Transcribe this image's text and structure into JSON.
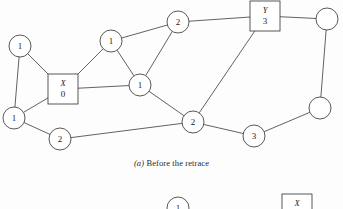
{
  "figure": {
    "caption_tag": "(a)",
    "caption_text": " Before the retrace",
    "width": 343,
    "height": 209,
    "stroke_color": "#3a3a3a",
    "fill_color": "#ffffff",
    "background": "#fdfdfd"
  },
  "graph": {
    "nodes": [
      {
        "id": "n1",
        "shape": "circle",
        "label": "1",
        "name": "",
        "cx": 20,
        "cy": 46,
        "r": 11
      },
      {
        "id": "n2",
        "shape": "square",
        "label": "0",
        "name": "X",
        "cx": 63,
        "cy": 89,
        "r": 15
      },
      {
        "id": "n3",
        "shape": "circle",
        "label": "1",
        "name": "",
        "cx": 14,
        "cy": 118,
        "r": 11
      },
      {
        "id": "n4",
        "shape": "circle",
        "label": "2",
        "name": "",
        "cx": 60,
        "cy": 139,
        "r": 11
      },
      {
        "id": "n5",
        "shape": "circle",
        "label": "1",
        "name": "",
        "cx": 111,
        "cy": 41,
        "r": 11
      },
      {
        "id": "n6",
        "shape": "circle",
        "label": "2",
        "name": "",
        "cx": 178,
        "cy": 22,
        "r": 11
      },
      {
        "id": "n7",
        "shape": "circle",
        "label": "1",
        "name": "",
        "cx": 140,
        "cy": 85,
        "r": 11
      },
      {
        "id": "n8",
        "shape": "square",
        "label": "3",
        "name": "Y",
        "cx": 265,
        "cy": 16,
        "r": 15
      },
      {
        "id": "n9",
        "shape": "circle",
        "label": "",
        "name": "",
        "cx": 327,
        "cy": 19,
        "r": 11
      },
      {
        "id": "n10",
        "shape": "circle",
        "label": "2",
        "name": "",
        "cx": 193,
        "cy": 122,
        "r": 11
      },
      {
        "id": "n11",
        "shape": "circle",
        "label": "3",
        "name": "",
        "cx": 254,
        "cy": 136,
        "r": 11
      },
      {
        "id": "n12",
        "shape": "circle",
        "label": "",
        "name": "",
        "cx": 320,
        "cy": 108,
        "r": 11
      }
    ],
    "edges": [
      {
        "from": "n1",
        "to": "n2"
      },
      {
        "from": "n1",
        "to": "n3"
      },
      {
        "from": "n3",
        "to": "n2"
      },
      {
        "from": "n3",
        "to": "n4"
      },
      {
        "from": "n4",
        "to": "n10"
      },
      {
        "from": "n2",
        "to": "n5"
      },
      {
        "from": "n2",
        "to": "n7"
      },
      {
        "from": "n5",
        "to": "n6"
      },
      {
        "from": "n5",
        "to": "n7"
      },
      {
        "from": "n6",
        "to": "n7"
      },
      {
        "from": "n6",
        "to": "n8"
      },
      {
        "from": "n7",
        "to": "n10"
      },
      {
        "from": "n8",
        "to": "n9"
      },
      {
        "from": "n8",
        "to": "n10"
      },
      {
        "from": "n9",
        "to": "n12"
      },
      {
        "from": "n10",
        "to": "n11"
      },
      {
        "from": "n11",
        "to": "n12"
      }
    ]
  },
  "partial_figure": {
    "nodes": [
      {
        "id": "p1",
        "shape": "circle",
        "label": "1",
        "name": "",
        "cx": 178,
        "cy": 208,
        "r": 11
      },
      {
        "id": "p2",
        "shape": "square",
        "label": "",
        "name": "X",
        "cx": 297,
        "cy": 209,
        "r": 15
      }
    ]
  }
}
